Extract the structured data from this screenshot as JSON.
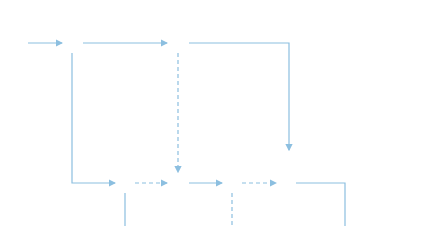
{
  "legend": {
    "row1": [
      "ES",
      "LS",
      "TF"
    ],
    "row2": [
      "EF",
      "LF",
      "FF"
    ]
  },
  "project_duration": "Tc=Tp=13",
  "nodes": [
    "1",
    "2",
    "3",
    "4",
    "5",
    "6",
    "7",
    "8",
    "9",
    "10"
  ],
  "activities": [
    {
      "name": "A",
      "duration": "2",
      "es": "0",
      "ls": "0",
      "ef": "2",
      "lf": "2"
    },
    {
      "name": "B",
      "duration": "2",
      "es": "2",
      "ls": "3",
      "ef": "4",
      "lf": "5"
    },
    {
      "name": "C",
      "duration": "3",
      "es": "4",
      "ls": "8",
      "ef": "7",
      "lf": "9"
    },
    {
      "name": "D",
      "duration": "3",
      "es": "2",
      "ls": "2",
      "ef": "5",
      "lf": "5"
    },
    {
      "name": "E",
      "duration": "3",
      "es": "5",
      "ls": "5",
      "ef": "8",
      "lf": "8"
    },
    {
      "name": "F",
      "duration": "1",
      "es": "8",
      "ls": "10",
      "ef": "9",
      "lf": "11"
    },
    {
      "name": "G",
      "duration": "2",
      "es": "5",
      "ls": "6",
      "ef": "7",
      "lf": "8"
    },
    {
      "name": "H",
      "duration": "3",
      "es": "8",
      "ls": "8",
      "ef": "11",
      "lf": "11"
    },
    {
      "name": "I",
      "duration": "2",
      "es": "11",
      "ls": "11",
      "ef": "13",
      "lf": "13"
    }
  ],
  "dummies": [
    {
      "from": "3",
      "to": "5",
      "es": "4",
      "ls": "5",
      "ef": "4",
      "lf": "5"
    },
    {
      "from": "4",
      "to": "5",
      "es": "5",
      "ls": "5",
      "ef": "5",
      "lf": "5"
    },
    {
      "from": "6",
      "to": "7",
      "es": "8",
      "ls": "10",
      "ef": "8",
      "lf": "10"
    },
    {
      "from": "6",
      "to": "8",
      "es": "8",
      "ls": "8",
      "ef": "8",
      "lf": "8"
    }
  ]
}
